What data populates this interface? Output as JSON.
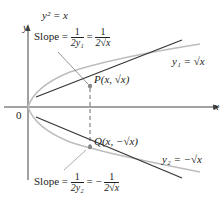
{
  "title_equation": "y² = x",
  "axes": {
    "x_label": "x",
    "y_label": "y",
    "origin_label": "0"
  },
  "points": {
    "P": "P(x, √x)",
    "Q": "Q(x, −√x)"
  },
  "curves": {
    "upper": "y₁ = √x",
    "lower": "y₂ = −√x"
  },
  "slope_top": {
    "prefix": "Slope =",
    "num1": "1",
    "den1": "2y₁",
    "eq": "=",
    "num2": "1",
    "den2": "2√x"
  },
  "slope_bottom": {
    "prefix": "Slope =",
    "num1": "1",
    "den1": "2y₂",
    "eq": "= −",
    "num2": "1",
    "den2": "2√x"
  },
  "colors": {
    "curve": "#bdbdbd",
    "tangent": "#333333",
    "axis": "#444444"
  }
}
